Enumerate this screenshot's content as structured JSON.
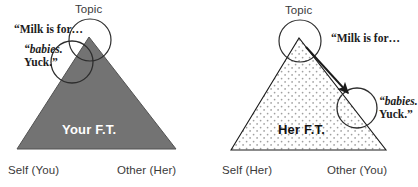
{
  "figure": {
    "type": "diagram",
    "background_color": "#ffffff",
    "panels": [
      {
        "id": "left",
        "triangle": {
          "label": "Your F.T.",
          "fill_color": "#737373",
          "stroke_color": "#4a4a4a",
          "label_color": "#ffffff",
          "fill_style": "solid-gray"
        },
        "apex_label": "Topic",
        "base_labels": {
          "left": "Self (You)",
          "right": "Other (Her)"
        },
        "circles": [
          {
            "name": "topic-circle",
            "label": "Topic"
          },
          {
            "name": "utterance-circle",
            "label": ""
          }
        ],
        "annotations": [
          {
            "name": "milk-quote",
            "text": "“Milk is for…"
          },
          {
            "name": "babies-quote-line1",
            "text": "“babies.",
            "italic": true
          },
          {
            "name": "babies-quote-line2",
            "text": "Yuck.”",
            "italic": false
          }
        ],
        "arrow": false
      },
      {
        "id": "right",
        "triangle": {
          "label": "Her F.T.",
          "fill_color": "#ffffff",
          "stroke_color": "#1a1a1a",
          "label_color": "#111111",
          "fill_style": "dotted-stipple",
          "dot_color": "#9a9a9a"
        },
        "apex_label": "Topic",
        "base_labels": {
          "left": "Self (Her)",
          "right": "Other (You)"
        },
        "circles": [
          {
            "name": "topic-circle",
            "label": "Topic"
          },
          {
            "name": "utterance-circle",
            "label": ""
          }
        ],
        "annotations": [
          {
            "name": "milk-quote",
            "text": "“Milk is for…"
          },
          {
            "name": "babies-quote-line1",
            "text": "“babies.",
            "italic": true
          },
          {
            "name": "babies-quote-line2",
            "text": "Yuck.”",
            "italic": false
          }
        ],
        "arrow": true,
        "arrow_color": "#1a1a1a"
      }
    ]
  }
}
